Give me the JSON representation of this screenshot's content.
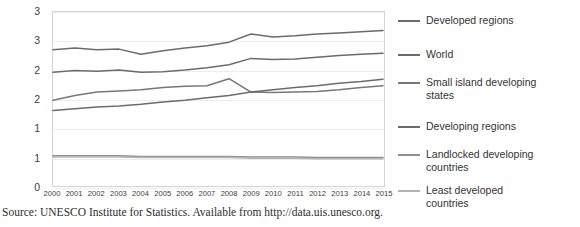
{
  "chart_data": {
    "type": "line",
    "title": "",
    "xlabel": "",
    "ylabel": "",
    "x": [
      2000,
      2001,
      2002,
      2003,
      2004,
      2005,
      2006,
      2007,
      2008,
      2009,
      2010,
      2011,
      2012,
      2013,
      2014,
      2015
    ],
    "categories": [
      "2000",
      "2001",
      "2002",
      "2003",
      "2004",
      "2005",
      "2006",
      "2007",
      "2008",
      "2009",
      "2010",
      "2011",
      "2012",
      "2013",
      "2014",
      "2015"
    ],
    "ylim": [
      0,
      3
    ],
    "yticks": [
      0,
      0.5,
      1,
      1.5,
      2,
      2.5,
      3
    ],
    "ytick_labels": [
      "0",
      "1",
      "1",
      "2",
      "2",
      "3"
    ],
    "ytick_values_shown": [
      0,
      0.5,
      1,
      1.5,
      2,
      2.5,
      3
    ],
    "grid": true,
    "legend_position": "right",
    "series": [
      {
        "name": "Developed regions",
        "color": "#6b6b6b",
        "values": [
          2.35,
          2.38,
          2.35,
          2.36,
          2.27,
          2.33,
          2.38,
          2.42,
          2.48,
          2.62,
          2.57,
          2.59,
          2.62,
          2.64,
          2.66,
          2.68
        ]
      },
      {
        "name": "World",
        "color": "#6b6b6b",
        "values": [
          1.96,
          1.99,
          1.98,
          2.0,
          1.96,
          1.97,
          2.0,
          2.04,
          2.09,
          2.2,
          2.18,
          2.19,
          2.22,
          2.25,
          2.27,
          2.29
        ]
      },
      {
        "name": "Small island developing\nstates",
        "color": "#777777",
        "values": [
          1.48,
          1.56,
          1.62,
          1.64,
          1.66,
          1.7,
          1.72,
          1.73,
          1.85,
          1.62,
          1.61,
          1.62,
          1.63,
          1.66,
          1.7,
          1.73
        ]
      },
      {
        "name": "Developing regions",
        "color": "#6b6b6b",
        "values": [
          1.3,
          1.33,
          1.36,
          1.38,
          1.41,
          1.45,
          1.48,
          1.52,
          1.56,
          1.62,
          1.66,
          1.7,
          1.73,
          1.77,
          1.8,
          1.84
        ]
      },
      {
        "name": "Landlocked developing\ncountries",
        "color": "#8f8f8f",
        "values": [
          0.52,
          0.52,
          0.52,
          0.52,
          0.51,
          0.51,
          0.51,
          0.51,
          0.51,
          0.5,
          0.5,
          0.5,
          0.49,
          0.49,
          0.49,
          0.49
        ]
      },
      {
        "name": "Least developed\ncountries",
        "color": "#b4b4b4",
        "values": [
          0.5,
          0.5,
          0.5,
          0.5,
          0.49,
          0.49,
          0.49,
          0.49,
          0.49,
          0.48,
          0.48,
          0.48,
          0.47,
          0.47,
          0.47,
          0.47
        ]
      }
    ]
  },
  "legend": {
    "items": [
      {
        "label": "Developed regions"
      },
      {
        "label": "World"
      },
      {
        "label": "Small island developing\nstates"
      },
      {
        "label": "Developing regions"
      },
      {
        "label": "Landlocked developing\ncountries"
      },
      {
        "label": "Least developed\ncountries"
      }
    ]
  },
  "caption": {
    "text": "Source: UNESCO Institute for Statistics. Available from http://data.uis.unesco.org."
  }
}
